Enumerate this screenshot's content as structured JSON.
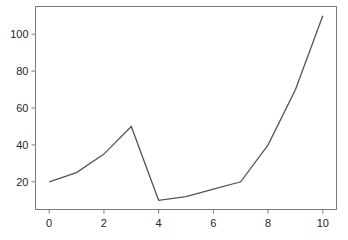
{
  "chart_data": {
    "type": "line",
    "title": "",
    "xlabel": "",
    "ylabel": "",
    "x": [
      0,
      1,
      2,
      3,
      4,
      5,
      6,
      7,
      8,
      9,
      10
    ],
    "series": [
      {
        "name": "series",
        "values": [
          20,
          25,
          35,
          50,
          10,
          12,
          16,
          20,
          40,
          70,
          110
        ],
        "color": "#555555"
      }
    ],
    "xlim": [
      -0.5,
      10.5
    ],
    "ylim": [
      5,
      115
    ],
    "xticks": [
      0,
      2,
      4,
      6,
      8,
      10
    ],
    "yticks": [
      20,
      40,
      60,
      80,
      100
    ],
    "grid": false,
    "legend": null
  }
}
